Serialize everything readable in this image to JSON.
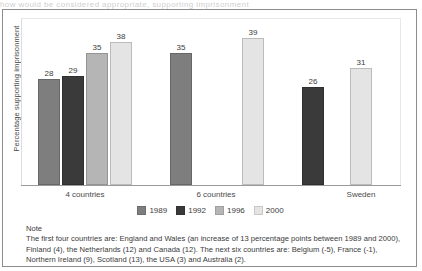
{
  "top_cut_text": "how would be considered appropriate, supporting imprisonment",
  "chart_data": {
    "type": "bar",
    "title": "",
    "xlabel": "",
    "ylabel": "Percentage supporting imprisonment",
    "ylim": [
      0,
      44
    ],
    "grid": false,
    "legend_position": "bottom",
    "categories": [
      "4 countries",
      "6 countries",
      "Sweden"
    ],
    "series": [
      {
        "name": "1989",
        "color": "#7e7e7e",
        "values": [
          28,
          35,
          null
        ]
      },
      {
        "name": "1992",
        "color": "#3a3a3a",
        "values": [
          29,
          null,
          26
        ]
      },
      {
        "name": "1996",
        "color": "#b5b5b5",
        "values": [
          35,
          null,
          null
        ]
      },
      {
        "name": "2000",
        "color": "#e4e4e4",
        "values": [
          38,
          39,
          31
        ]
      }
    ],
    "bars": [
      {
        "group": "4 countries",
        "series": "1989",
        "value": 28,
        "label": "28",
        "color": "#7e7e7e",
        "x": 16,
        "width": 22
      },
      {
        "group": "4 countries",
        "series": "1992",
        "value": 29,
        "label": "29",
        "color": "#3a3a3a",
        "x": 40,
        "width": 22
      },
      {
        "group": "4 countries",
        "series": "1996",
        "value": 35,
        "label": "35",
        "color": "#b5b5b5",
        "x": 64,
        "width": 22
      },
      {
        "group": "4 countries",
        "series": "2000",
        "value": 38,
        "label": "38",
        "color": "#e4e4e4",
        "x": 88,
        "width": 22
      },
      {
        "group": "6 countries",
        "series": "1989",
        "value": 35,
        "label": "35",
        "color": "#7e7e7e",
        "x": 148,
        "width": 22
      },
      {
        "group": "6 countries",
        "series": "2000",
        "value": 39,
        "label": "39",
        "color": "#e4e4e4",
        "x": 220,
        "width": 22
      },
      {
        "group": "Sweden",
        "series": "1992",
        "value": 26,
        "label": "26",
        "color": "#3a3a3a",
        "x": 280,
        "width": 22
      },
      {
        "group": "Sweden",
        "series": "2000",
        "value": 31,
        "label": "31",
        "color": "#e4e4e4",
        "x": 328,
        "width": 22
      }
    ],
    "group_tick_positions": [
      63,
      194,
      339
    ]
  },
  "legend": {
    "entries": [
      {
        "label": "1989",
        "color": "#7e7e7e"
      },
      {
        "label": "1992",
        "color": "#3a3a3a"
      },
      {
        "label": "1996",
        "color": "#b5b5b5"
      },
      {
        "label": "2000",
        "color": "#e4e4e4"
      }
    ]
  },
  "note": {
    "heading": "Note",
    "body": "The first four countries are: England and Wales (an increase of 13 percentage points between 1989 and 2000), Finland (4), the Netherlands (12) and Canada (12). The next six countries are: Belgium (-5), France (-1), Northern Ireland (9), Scotland (13), the USA (3) and Australia (2)."
  }
}
